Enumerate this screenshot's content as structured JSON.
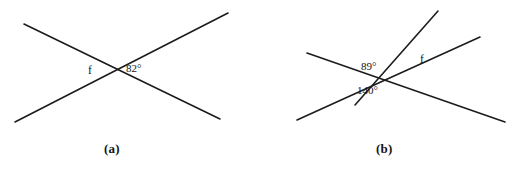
{
  "figure": {
    "background_color": "#ffffff",
    "line_color": "#1c1c1c",
    "text_color": "#141414",
    "panels": [
      {
        "id": "a",
        "caption": "(a)",
        "description": "Two straight lines crossing at a single point forming an X",
        "intersection": {
          "x": 115,
          "y": 71
        },
        "lines": [
          {
            "name": "line-falling",
            "x1": 24,
            "y1": 24,
            "x2": 220,
            "y2": 119
          },
          {
            "name": "line-rising",
            "x1": 15,
            "y1": 122,
            "x2": 228,
            "y2": 13
          }
        ],
        "labels": [
          {
            "name": "angle-f",
            "text": "f",
            "kind": "variable",
            "position": "left-of-intersection"
          },
          {
            "name": "angle-82",
            "text": "82°",
            "kind": "measure",
            "value": 82,
            "position": "right-of-intersection"
          }
        ]
      },
      {
        "id": "b",
        "caption": "(b)",
        "description": "Three straight lines meeting at one point",
        "intersection": {
          "x": 383,
          "y": 80
        },
        "lines": [
          {
            "name": "line-shallow-falling",
            "x1": 307,
            "y1": 53,
            "x2": 505,
            "y2": 122
          },
          {
            "name": "line-shallow-rising",
            "x1": 297,
            "y1": 120,
            "x2": 480,
            "y2": 37
          },
          {
            "name": "line-steep-rising",
            "x1": 355,
            "y1": 105,
            "x2": 438,
            "y2": 11
          }
        ],
        "labels": [
          {
            "name": "angle-89",
            "text": "89°",
            "kind": "measure",
            "value": 89,
            "position": "upper-left-of-intersection"
          },
          {
            "name": "angle-f",
            "text": "f",
            "kind": "variable",
            "position": "upper-right-of-intersection"
          },
          {
            "name": "angle-140",
            "text": "140°",
            "kind": "measure",
            "value": 140,
            "position": "below-intersection"
          }
        ]
      }
    ]
  }
}
